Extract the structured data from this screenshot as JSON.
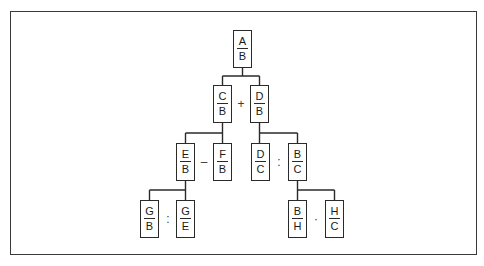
{
  "diagram": {
    "type": "fraction-decomposition-tree",
    "nodes": {
      "root": {
        "num": "A",
        "den": "B"
      },
      "cb": {
        "num": "C",
        "den": "B"
      },
      "db": {
        "num": "D",
        "den": "B"
      },
      "eb": {
        "num": "E",
        "den": "B"
      },
      "fb": {
        "num": "F",
        "den": "B"
      },
      "dc": {
        "num": "D",
        "den": "C"
      },
      "bc": {
        "num": "B",
        "den": "C"
      },
      "gb": {
        "num": "G",
        "den": "B"
      },
      "ge": {
        "num": "G",
        "den": "E"
      },
      "bh": {
        "num": "B",
        "den": "H"
      },
      "hc": {
        "num": "H",
        "den": "C"
      }
    },
    "operators": {
      "cb_db": "+",
      "eb_fb": "–",
      "dc_bc": ":",
      "gb_ge": ":",
      "bh_hc": "·"
    },
    "edges": [
      {
        "from": "root",
        "to": [
          "cb",
          "db"
        ]
      },
      {
        "from": "cb",
        "to": [
          "eb",
          "fb"
        ]
      },
      {
        "from": "db",
        "to": [
          "dc",
          "bc"
        ]
      },
      {
        "from": "eb",
        "to": [
          "gb",
          "ge"
        ]
      },
      {
        "from": "bc",
        "to": [
          "bh",
          "hc"
        ]
      }
    ]
  }
}
